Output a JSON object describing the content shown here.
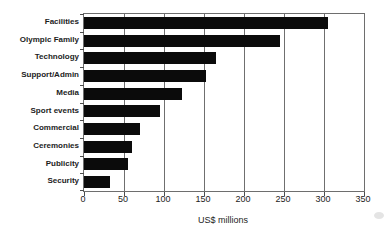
{
  "chart_data": {
    "type": "bar",
    "orientation": "horizontal",
    "title": "",
    "categories": [
      "Facilities",
      "Olympic Family",
      "Technology",
      "Support/Admin",
      "Media",
      "Sport events",
      "Commercial",
      "Ceremonies",
      "Publicity",
      "Security"
    ],
    "values": [
      305,
      245,
      165,
      153,
      123,
      95,
      70,
      60,
      55,
      33
    ],
    "xlabel": "US$ millions",
    "ylabel": "",
    "xlim": [
      0,
      350
    ],
    "xticks": [
      0,
      50,
      100,
      150,
      200,
      250,
      300,
      350
    ],
    "grid": true,
    "legend": false,
    "bars_sorted_descending": true,
    "colors": {
      "bar": "#0b0b0b",
      "plot_border": "#6e6e6e",
      "gridline": "#6f6f6f",
      "text": "#1c1c1c",
      "background": "#ffffff"
    }
  }
}
